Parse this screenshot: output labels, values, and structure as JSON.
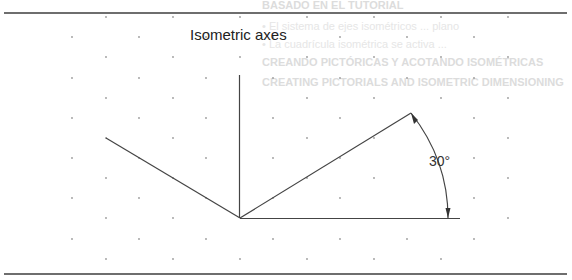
{
  "diagram": {
    "title": "Isometric axes",
    "angle_label": "30°",
    "colors": {
      "line": "#444444",
      "rule": "#6e6e6e",
      "grid_dot": "#9a9a9a",
      "ghost_text": "#e0e0e0"
    },
    "ghost_text": [
      "BASADO EN EL TUTORIAL",
      "• El sistema de ejes isométricos ... plano",
      "• La cuadrícula isométrica se activa ...",
      "CREANDO PICTÓRICAS Y ACOTANDO ISOMÉTRICAS",
      "CREATING PICTORIALS AND ISOMETRIC DIMENSIONING"
    ]
  }
}
